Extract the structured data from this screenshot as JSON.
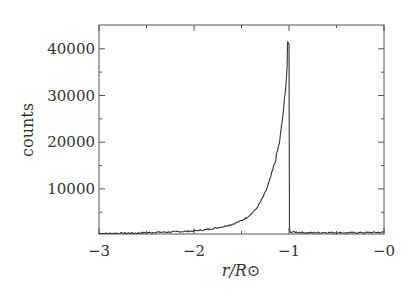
{
  "chart_data": {
    "type": "line",
    "title": "",
    "xlabel": "r/R⊙",
    "ylabel": "counts",
    "xlim": [
      -3,
      0
    ],
    "ylim": [
      0,
      44000
    ],
    "grid": false,
    "legend": null,
    "x_ticks": [
      -3,
      -2,
      -1,
      0
    ],
    "x_tick_labels": [
      "−3",
      "−2",
      "−1",
      "−0"
    ],
    "x_minor_ticks": [
      -2.5,
      -1.5,
      -0.5
    ],
    "y_ticks": [
      10000,
      20000,
      30000,
      40000
    ],
    "y_tick_labels": [
      "10000",
      "20000",
      "30000",
      "40000"
    ],
    "y_minor_ticks": [
      5000,
      15000,
      25000,
      35000
    ],
    "series": [
      {
        "name": "counts",
        "color": "#333333",
        "x": [
          -3.0,
          -2.8,
          -2.6,
          -2.4,
          -2.2,
          -2.0,
          -1.9,
          -1.8,
          -1.7,
          -1.6,
          -1.5,
          -1.45,
          -1.4,
          -1.35,
          -1.3,
          -1.25,
          -1.2,
          -1.15,
          -1.1,
          -1.08,
          -1.06,
          -1.04,
          -1.03,
          -1.02,
          -1.015,
          -1.0,
          -0.995,
          -0.99,
          -0.9,
          -0.8,
          -0.6,
          -0.4,
          -0.2,
          0.0
        ],
        "y": [
          400,
          500,
          550,
          700,
          800,
          1000,
          1200,
          1500,
          1900,
          2400,
          3200,
          3800,
          4600,
          5600,
          7200,
          9200,
          12000,
          15500,
          20000,
          23000,
          26500,
          30500,
          33000,
          36000,
          41500,
          41000,
          1500,
          800,
          700,
          600,
          650,
          600,
          650,
          700
        ]
      }
    ]
  }
}
